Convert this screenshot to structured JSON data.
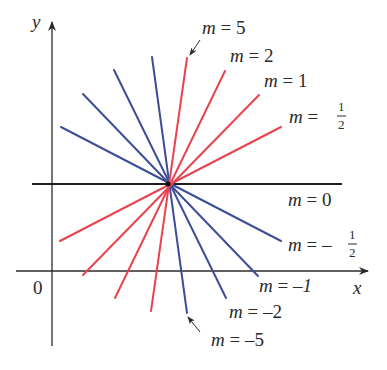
{
  "diagram": {
    "colors": {
      "positive_slope": "#e8434f",
      "negative_slope": "#3c4e9a",
      "axis": "#2a2a2a",
      "zero_slope": "#1e1e1e"
    },
    "axes": {
      "x_label": "x",
      "y_label": "y",
      "origin_label": "0"
    },
    "center_point": {
      "px": [
        168,
        184
      ]
    },
    "lines": [
      {
        "slope": "5",
        "label": "m = 5",
        "color": "positive_slope",
        "ends": [
          [
            187,
            58
          ],
          [
            150,
            310
          ]
        ],
        "label_pos": [
          202,
          34
        ],
        "arrow": true
      },
      {
        "slope": "2",
        "label": "m = 2",
        "color": "positive_slope",
        "ends": [
          [
            225,
            71
          ],
          [
            115,
            298
          ]
        ],
        "label_pos": [
          230,
          62
        ]
      },
      {
        "slope": "1",
        "label": "m = 1",
        "color": "positive_slope",
        "ends": [
          [
            259,
            95
          ],
          [
            83,
            275
          ]
        ],
        "label_pos": [
          264,
          87
        ]
      },
      {
        "slope": "1/2",
        "label": "m = ",
        "frac": [
          "1",
          "2"
        ],
        "color": "positive_slope",
        "ends": [
          [
            281,
            127
          ],
          [
            60,
            241
          ]
        ],
        "label_pos": [
          289,
          123
        ]
      },
      {
        "slope": "0",
        "label": "m = 0",
        "color": "zero_slope",
        "ends": [
          [
            32,
            184
          ],
          [
            342,
            184
          ]
        ],
        "label_pos": [
          288,
          206
        ]
      },
      {
        "slope": "-1/2",
        "label": "m = – ",
        "frac": [
          "1",
          "2"
        ],
        "color": "negative_slope",
        "ends": [
          [
            61,
            127
          ],
          [
            281,
            241
          ]
        ],
        "label_pos": [
          288,
          251
        ]
      },
      {
        "slope": "-1",
        "label": "m = –",
        "label_suffix": "1",
        "color": "negative_slope",
        "ends": [
          [
            83,
            94
          ],
          [
            258,
            276
          ]
        ],
        "label_pos": [
          259,
          292
        ]
      },
      {
        "slope": "-2",
        "label": "m = –2",
        "color": "negative_slope",
        "ends": [
          [
            114,
            70
          ],
          [
            226,
            298
          ]
        ],
        "label_pos": [
          229,
          318
        ]
      },
      {
        "slope": "-5",
        "label": "m = –5",
        "color": "negative_slope",
        "ends": [
          [
            152,
            57
          ],
          [
            187,
            313
          ]
        ],
        "label_pos": [
          211,
          346
        ],
        "arrow": true
      }
    ],
    "annotations": [
      {
        "text": "m = 5",
        "points_to": "top of slope-5 line"
      },
      {
        "text": "m = –5",
        "points_to": "bottom of slope-(-5) line"
      }
    ]
  }
}
